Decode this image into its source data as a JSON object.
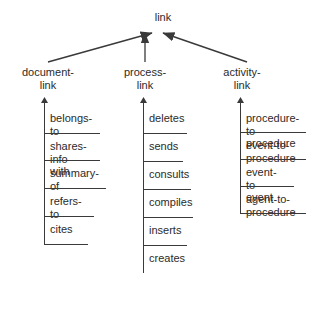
{
  "diagram": {
    "type": "taxonomy-hierarchy",
    "root": {
      "label": "link"
    },
    "subclasses": [
      {
        "id": "document-link",
        "label": "document-\nlink",
        "instances": [
          {
            "label": "belongs-to",
            "lines": 1,
            "tick_width": 56
          },
          {
            "label": "shares-\ninfo-with",
            "lines": 2,
            "tick_width": 56
          },
          {
            "label": "summary-of",
            "lines": 1,
            "tick_width": 62
          },
          {
            "label": "refers-to",
            "lines": 1,
            "tick_width": 50
          },
          {
            "label": "cites",
            "lines": 1,
            "tick_width": 44
          }
        ]
      },
      {
        "id": "process-link",
        "label": "process-\nlink",
        "instances": [
          {
            "label": "deletes",
            "lines": 1,
            "tick_width": 44
          },
          {
            "label": "sends",
            "lines": 1,
            "tick_width": 40
          },
          {
            "label": "consults",
            "lines": 1,
            "tick_width": 48
          },
          {
            "label": "compiles",
            "lines": 1,
            "tick_width": 50
          },
          {
            "label": "inserts",
            "lines": 1,
            "tick_width": 44
          },
          {
            "label": "creates",
            "lines": 1,
            "tick_width": 0
          }
        ]
      },
      {
        "id": "activity-link",
        "label": "activity-\nlink",
        "instances": [
          {
            "label": "procedure-to-\nprocedure",
            "lines": 2,
            "tick_width": 66
          },
          {
            "label": "event-to-\nprocedure",
            "lines": 2,
            "tick_width": 66
          },
          {
            "label": "event-to-\nevent",
            "lines": 2,
            "tick_width": 54
          },
          {
            "label": "agent-to-\nprocedure",
            "lines": 2,
            "tick_width": 66
          }
        ]
      }
    ],
    "style": {
      "line_color": "#3a3a3a",
      "text_color": "#2b2b2b",
      "background": "#ffffff"
    }
  }
}
